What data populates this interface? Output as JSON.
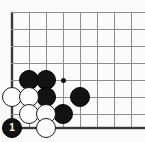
{
  "diagram": {
    "board": {
      "type": "go-board-corner",
      "grid_spacing": 17,
      "line_color": "#8d8d8d",
      "edge_color": "#3a3a3a",
      "background_color": "#fbfbfb",
      "origin_x": 12,
      "origin_y": 12,
      "columns_x": [
        12,
        29,
        46,
        63,
        80,
        97,
        114,
        131
      ],
      "rows_y": [
        12,
        29,
        46,
        63,
        80,
        97,
        114,
        128
      ],
      "left_edge_x": 12,
      "bottom_edge_y": 128,
      "grid_visible": true
    },
    "star_points": [
      {
        "name": "hoshi-marker",
        "x": 63,
        "y": 80,
        "radius": 2.5,
        "color": "#111111"
      }
    ],
    "stones": [
      {
        "name": "black-stone-c3",
        "color": "black",
        "x": 29,
        "y": 80,
        "radius": 10,
        "label": ""
      },
      {
        "name": "black-stone-d3",
        "color": "black",
        "x": 46,
        "y": 80,
        "radius": 10,
        "label": ""
      },
      {
        "name": "black-stone-d2",
        "color": "black",
        "x": 46,
        "y": 97,
        "radius": 10,
        "label": ""
      },
      {
        "name": "black-stone-f2",
        "color": "black",
        "x": 80,
        "y": 97,
        "radius": 10,
        "label": ""
      },
      {
        "name": "black-stone-e1",
        "color": "black",
        "x": 63,
        "y": 114,
        "radius": 10,
        "label": ""
      },
      {
        "name": "black-stone-move-1",
        "color": "black",
        "x": 12,
        "y": 128,
        "radius": 10,
        "label": "1"
      },
      {
        "name": "white-stone-b2",
        "color": "white",
        "x": 12,
        "y": 97,
        "radius": 10,
        "label": ""
      },
      {
        "name": "white-stone-c2",
        "color": "white",
        "x": 29,
        "y": 97,
        "radius": 10,
        "label": ""
      },
      {
        "name": "white-stone-c1",
        "color": "white",
        "x": 29,
        "y": 114,
        "radius": 10,
        "label": ""
      },
      {
        "name": "white-stone-d1",
        "color": "white",
        "x": 46,
        "y": 114,
        "radius": 10,
        "label": ""
      },
      {
        "name": "white-stone-d0",
        "color": "white",
        "x": 46,
        "y": 128,
        "radius": 10,
        "label": ""
      }
    ],
    "move_numbers": [
      "1"
    ]
  }
}
